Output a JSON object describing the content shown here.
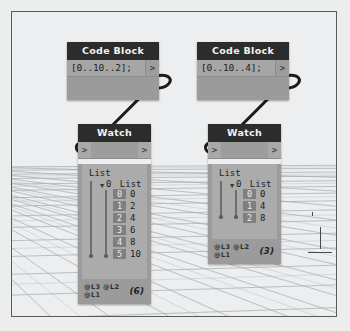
{
  "canvas": {
    "background_color": "#eceeef",
    "grid_color": "#9aa0a3",
    "frame_color": "#5a5a5a"
  },
  "theme": {
    "header_bg": "#2c2c2c",
    "header_text": "#f2f2f2",
    "node_body": "#9b9b9b",
    "code_field_bg": "#a6a6a6",
    "preview_bg": "#ababab",
    "index_badge_bg": "#7f7f7f",
    "wire_color": "#1c1c1c"
  },
  "nodes": [
    {
      "id": "code-block-left",
      "type": "CodeBlock",
      "title": "Code Block",
      "code": "[0..10..2];",
      "output_port": ">"
    },
    {
      "id": "code-block-right",
      "type": "CodeBlock",
      "title": "Code Block",
      "code": "[0..10..4];",
      "output_port": ">"
    },
    {
      "id": "watch-left",
      "type": "Watch",
      "title": "Watch",
      "input_port": ">",
      "output_port": ">",
      "root_label": "List",
      "branch_index": "0",
      "branch_label": "List",
      "items": [
        {
          "index": "0",
          "value": "0"
        },
        {
          "index": "1",
          "value": "2"
        },
        {
          "index": "2",
          "value": "4"
        },
        {
          "index": "3",
          "value": "6"
        },
        {
          "index": "4",
          "value": "8"
        },
        {
          "index": "5",
          "value": "10"
        }
      ],
      "levels": "@L3 @L2 @L1",
      "count": "(6)"
    },
    {
      "id": "watch-right",
      "type": "Watch",
      "title": "Watch",
      "input_port": ">",
      "output_port": ">",
      "root_label": "List",
      "branch_index": "0",
      "branch_label": "List",
      "items": [
        {
          "index": "0",
          "value": "0"
        },
        {
          "index": "1",
          "value": "4"
        },
        {
          "index": "2",
          "value": "8"
        }
      ],
      "levels": "@L3 @L2 @L1",
      "count": "(3)"
    }
  ]
}
